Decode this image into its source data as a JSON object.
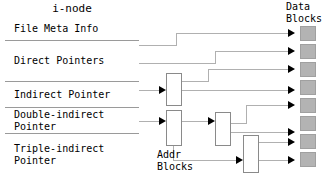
{
  "diagram": {
    "title_inode": "i-node",
    "title_data_blocks": "Data\nBlocks",
    "title_addr_blocks": "Addr\nBlocks",
    "colors": {
      "data_block_fill": "#b3b3b3",
      "data_block_border": "#a0a0a0",
      "addr_block_fill": "#ffffff",
      "addr_block_border": "#8a8a8a",
      "wire": "#b0b0b0",
      "arrow": "#000000",
      "inode_border": "#555555",
      "inode_divider": "#9a9a9a",
      "text": "#000000",
      "background": "#ffffff"
    },
    "inode_rows": [
      {
        "label": "File Meta Info",
        "top": 18,
        "height": 23
      },
      {
        "label": "Direct Pointers",
        "top": 41,
        "height": 41
      },
      {
        "label": "Indirect Pointer",
        "top": 82,
        "height": 26
      },
      {
        "label": "Double-indirect\nPointer",
        "top": 108,
        "height": 26
      },
      {
        "label": "Triple-indirect\nPointer",
        "top": 134,
        "height": 42
      }
    ],
    "addr_blocks": [
      {
        "name": "addr-block-1",
        "x": 166,
        "y": 73,
        "w": 16,
        "h": 33
      },
      {
        "name": "addr-block-2",
        "x": 166,
        "y": 110,
        "w": 16,
        "h": 36
      },
      {
        "name": "addr-block-3",
        "x": 215,
        "y": 112,
        "w": 16,
        "h": 34
      },
      {
        "name": "addr-block-4",
        "x": 243,
        "y": 135,
        "w": 16,
        "h": 38
      }
    ],
    "data_blocks": [
      {
        "name": "data-block-1",
        "x": 300,
        "y": 26,
        "w": 16,
        "h": 15
      },
      {
        "name": "data-block-2",
        "x": 300,
        "y": 44,
        "w": 16,
        "h": 15
      },
      {
        "name": "data-block-3",
        "x": 300,
        "y": 62,
        "w": 16,
        "h": 15
      },
      {
        "name": "data-block-4",
        "x": 300,
        "y": 80,
        "w": 16,
        "h": 15
      },
      {
        "name": "data-block-5",
        "x": 300,
        "y": 98,
        "w": 16,
        "h": 15
      },
      {
        "name": "data-block-6",
        "x": 300,
        "y": 116,
        "w": 16,
        "h": 15
      },
      {
        "name": "data-block-7",
        "x": 300,
        "y": 134,
        "w": 16,
        "h": 15
      },
      {
        "name": "data-block-8",
        "x": 300,
        "y": 152,
        "w": 16,
        "h": 15
      }
    ],
    "wires": [
      {
        "name": "wire-direct-1-to-data-1",
        "points": "139,45 176,45 176,33 294,33"
      },
      {
        "name": "wire-direct-2-to-data-2",
        "points": "139,63 215,63 215,51 294,51"
      },
      {
        "name": "wire-addr1-to-data-3",
        "points": "182,81 208,81 208,69 294,69"
      },
      {
        "name": "wire-addr1-to-data-4",
        "points": "182,90 294,90"
      },
      {
        "name": "wire-addr3-to-data-5",
        "points": "231,123 246,123 246,105 294,105"
      },
      {
        "name": "wire-addr3-to-data-6",
        "points": "231,132 294,132"
      },
      {
        "name": "wire-addr4-to-data-7",
        "points": "259,142 294,142"
      },
      {
        "name": "wire-addr4-to-data-8",
        "points": "259,160 294,160"
      },
      {
        "name": "wire-indirect-to-addr1",
        "points": "139,90 162,90"
      },
      {
        "name": "wire-double-to-addr2",
        "points": "139,121 162,121"
      },
      {
        "name": "wire-addr2-to-addr3",
        "points": "182,121 211,121"
      },
      {
        "name": "wire-addr2-to-addr4",
        "points": "173,146 173,160 239,160"
      }
    ],
    "arrows": [
      {
        "name": "arrow-data-1",
        "x": 294,
        "y": 33
      },
      {
        "name": "arrow-data-2",
        "x": 294,
        "y": 51
      },
      {
        "name": "arrow-data-3",
        "x": 294,
        "y": 69
      },
      {
        "name": "arrow-data-4",
        "x": 294,
        "y": 90
      },
      {
        "name": "arrow-data-5",
        "x": 294,
        "y": 105
      },
      {
        "name": "arrow-data-6",
        "x": 294,
        "y": 132
      },
      {
        "name": "arrow-data-7",
        "x": 294,
        "y": 142
      },
      {
        "name": "arrow-data-8",
        "x": 294,
        "y": 160
      },
      {
        "name": "arrow-addr-1",
        "x": 165,
        "y": 90
      },
      {
        "name": "arrow-addr-2",
        "x": 165,
        "y": 121
      },
      {
        "name": "arrow-addr-3",
        "x": 214,
        "y": 121
      },
      {
        "name": "arrow-addr-4",
        "x": 242,
        "y": 160
      }
    ]
  }
}
